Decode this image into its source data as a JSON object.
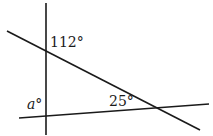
{
  "diagram": {
    "type": "geometry-angles",
    "line_color": "#1a1a1a",
    "lines": [
      {
        "id": "vertical",
        "x1": 46,
        "y1": 3,
        "x2": 46,
        "y2": 135
      },
      {
        "id": "diagonal",
        "x1": 7,
        "y1": 31,
        "x2": 200,
        "y2": 130
      },
      {
        "id": "bottom",
        "x1": 19,
        "y1": 118,
        "x2": 209,
        "y2": 104
      }
    ],
    "labels": {
      "top_angle": "112°",
      "right_angle": "25°",
      "unknown_angle": "a°"
    }
  }
}
